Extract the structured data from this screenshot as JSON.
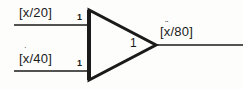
{
  "diagram": {
    "type": "summing-amplifier-block-diagram",
    "background_color": "#fdfdfc",
    "line_color": "#1a1a1a",
    "inputs": [
      {
        "id": "input-top",
        "label_open": "[",
        "variable": "x",
        "dots": "",
        "divisor": "/20",
        "label_close": "]",
        "label_full": "[x/20]",
        "gain": "1"
      },
      {
        "id": "input-bottom",
        "label_open": "[",
        "variable": "x",
        "dots": "˙",
        "divisor": "/40",
        "label_close": "]",
        "label_full": "[ẋ/40]",
        "gain": "1"
      }
    ],
    "amplifier": {
      "shape": "triangle-right",
      "gain": "1"
    },
    "output": {
      "id": "output",
      "label_open": "[",
      "variable": "x",
      "dots": "¨",
      "divisor": "/80",
      "label_close": "]",
      "label_full": "[ẍ/80]"
    }
  }
}
